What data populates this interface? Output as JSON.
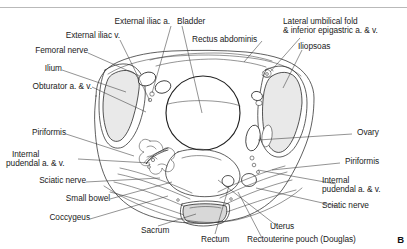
{
  "figure": {
    "panel_letter": "B",
    "accent_line_color": "#b9b9b9",
    "outline_color": "#2b2b2b",
    "shade_color": "#e9e9e9"
  },
  "labels": {
    "external_iliac_a": "External iliac a.",
    "external_iliac_v": "External iliac v.",
    "femoral_nerve": "Femoral nerve",
    "ilium": "Ilium",
    "obturator_av": "Obturator a. & v.",
    "piriformis_left": "Piriformis",
    "internal_pudendal_left_line1": "Internal",
    "internal_pudendal_left_line2": "pudendal a. & v.",
    "sciatic_nerve_left": "Sciatic nerve",
    "small_bowel": "Small bowel",
    "coccygeus": "Coccygeus",
    "bladder": "Bladder",
    "rectus_abdominis": "Rectus abdominis",
    "lateral_umbilical_line1": "Lateral umbilical fold",
    "lateral_umbilical_line2": "& inferior epigastric a. & v.",
    "iliopsoas": "Iliopsoas",
    "ovary": "Ovary",
    "piriformis_right": "Piriformis",
    "internal_pudendal_right_line1": "Internal",
    "internal_pudendal_right_line2": "pudendal a. & v.",
    "sciatic_nerve_right": "Sciatic nerve",
    "sacrum": "Sacrum",
    "rectum": "Rectum",
    "uterus": "Uterus",
    "rectouterine_pouch": "Rectouterine pouch (Douglas)"
  }
}
